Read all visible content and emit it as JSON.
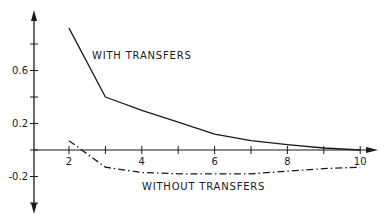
{
  "chart_data": {
    "type": "line",
    "title": "",
    "xlabel": "",
    "ylabel": "",
    "xlim": [
      0.9,
      10.6
    ],
    "ylim": [
      -0.55,
      1.0
    ],
    "grid": false,
    "legend_position": "inline annotations",
    "x_ticks": [
      2,
      3,
      4,
      5,
      6,
      7,
      8,
      9,
      10
    ],
    "x_tick_labels": [
      "2",
      "4",
      "6",
      "8",
      "10"
    ],
    "y_ticks": [
      0.8,
      0.6,
      0.4,
      0.2,
      0,
      -0.2,
      -0.4
    ],
    "y_tick_labels": [
      "0.6",
      "0.2",
      "-0.2"
    ],
    "x": [
      2,
      3,
      4,
      5,
      6,
      7,
      8,
      9,
      10
    ],
    "series": [
      {
        "name": "WITH TRANSFERS",
        "style": "solid",
        "values": [
          0.92,
          0.4,
          0.3,
          0.21,
          0.12,
          0.07,
          0.04,
          0.015,
          0.0
        ]
      },
      {
        "name": "WITHOUT TRANSFERS",
        "style": "dash-dot",
        "values": [
          0.07,
          -0.13,
          -0.17,
          -0.18,
          -0.18,
          -0.18,
          -0.16,
          -0.14,
          -0.13
        ]
      }
    ],
    "annotations": [
      {
        "text": "WITH TRANSFERS",
        "near_series": 0
      },
      {
        "text": "WITHOUT TRANSFERS",
        "near_series": 1
      }
    ]
  },
  "colors": {
    "line": "#1a1a1a",
    "background": "#ffffff"
  }
}
